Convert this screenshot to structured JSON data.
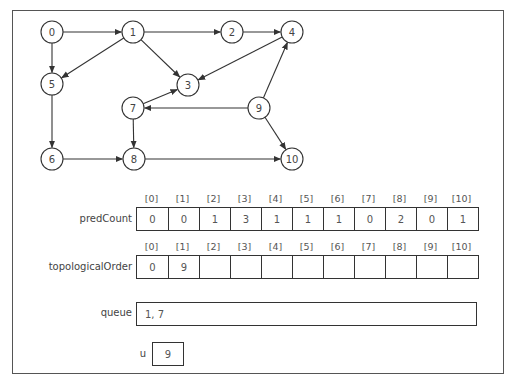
{
  "graph": {
    "nodes": [
      {
        "id": "0",
        "x": 52,
        "y": 32
      },
      {
        "id": "1",
        "x": 133,
        "y": 32
      },
      {
        "id": "2",
        "x": 232,
        "y": 32
      },
      {
        "id": "4",
        "x": 292,
        "y": 32
      },
      {
        "id": "5",
        "x": 52,
        "y": 84
      },
      {
        "id": "3",
        "x": 188,
        "y": 85
      },
      {
        "id": "7",
        "x": 133,
        "y": 108
      },
      {
        "id": "9",
        "x": 259,
        "y": 108
      },
      {
        "id": "6",
        "x": 52,
        "y": 159
      },
      {
        "id": "8",
        "x": 134,
        "y": 159
      },
      {
        "id": "10",
        "x": 292,
        "y": 159
      }
    ],
    "edges": [
      [
        "0",
        "1"
      ],
      [
        "0",
        "5"
      ],
      [
        "1",
        "2"
      ],
      [
        "1",
        "5"
      ],
      [
        "1",
        "3"
      ],
      [
        "2",
        "4"
      ],
      [
        "4",
        "3"
      ],
      [
        "7",
        "3"
      ],
      [
        "9",
        "7"
      ],
      [
        "9",
        "4"
      ],
      [
        "9",
        "10"
      ],
      [
        "5",
        "6"
      ],
      [
        "6",
        "8"
      ],
      [
        "7",
        "8"
      ],
      [
        "8",
        "10"
      ]
    ]
  },
  "predCount": {
    "label": "predCount",
    "indices": [
      "[0]",
      "[1]",
      "[2]",
      "[3]",
      "[4]",
      "[5]",
      "[6]",
      "[7]",
      "[8]",
      "[9]",
      "[10]"
    ],
    "values": [
      "0",
      "0",
      "1",
      "3",
      "1",
      "1",
      "1",
      "0",
      "2",
      "0",
      "1"
    ]
  },
  "topologicalOrder": {
    "label": "topologicalOrder",
    "indices": [
      "[0]",
      "[1]",
      "[2]",
      "[3]",
      "[4]",
      "[5]",
      "[6]",
      "[7]",
      "[8]",
      "[9]",
      "[10]"
    ],
    "values": [
      "0",
      "9",
      "",
      "",
      "",
      "",
      "",
      "",
      "",
      "",
      ""
    ]
  },
  "queue": {
    "label": "queue",
    "value": "1, 7"
  },
  "u": {
    "label": "u",
    "value": "9"
  }
}
